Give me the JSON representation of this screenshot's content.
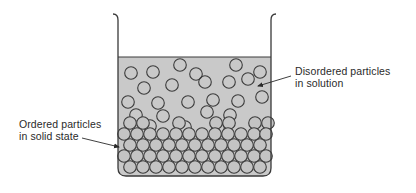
{
  "diagram": {
    "labels": {
      "disordered": {
        "line1": "Disordered particles",
        "line2": "in solution"
      },
      "ordered": {
        "line1": "Ordered particles",
        "line2": "in solid state"
      }
    },
    "colors": {
      "liquid": "#c9c9c9",
      "outline": "#3a3a3a",
      "particle_fill": "#c4c4c4",
      "text": "#2a2a2a"
    },
    "beaker": {
      "left": 118,
      "right": 271,
      "top": 14,
      "liquid_surface": 57,
      "bottom": 176,
      "corner_radius": 8
    },
    "particle_radius": 6.3,
    "disordered_particles": [
      [
        131,
        73
      ],
      [
        153,
        72
      ],
      [
        180,
        65
      ],
      [
        196,
        74
      ],
      [
        236,
        65
      ],
      [
        260,
        72
      ],
      [
        144,
        88
      ],
      [
        172,
        85
      ],
      [
        205,
        82
      ],
      [
        229,
        82
      ],
      [
        248,
        79
      ],
      [
        128,
        102
      ],
      [
        158,
        103
      ],
      [
        188,
        102
      ],
      [
        213,
        100
      ],
      [
        238,
        101
      ],
      [
        262,
        97
      ],
      [
        136,
        115
      ],
      [
        163,
        116
      ],
      [
        207,
        112
      ],
      [
        230,
        115
      ],
      [
        150,
        126
      ],
      [
        185,
        127
      ],
      [
        218,
        128
      ]
    ],
    "ordered_rows": [
      {
        "y": 123,
        "xs": [
          130,
          143,
          179,
          216,
          229,
          255,
          268
        ]
      },
      {
        "y": 134,
        "xs": [
          124,
          137,
          150,
          163,
          176,
          189,
          202,
          215,
          228,
          241,
          254,
          266
        ]
      },
      {
        "y": 145,
        "xs": [
          130,
          143,
          156,
          169,
          182,
          195,
          208,
          221,
          234,
          247,
          260
        ]
      },
      {
        "y": 156,
        "xs": [
          124,
          137,
          150,
          163,
          176,
          189,
          202,
          215,
          228,
          241,
          254,
          266
        ]
      },
      {
        "y": 167,
        "xs": [
          130,
          143,
          156,
          169,
          182,
          195,
          208,
          221,
          234,
          247,
          260
        ]
      }
    ],
    "arrows": {
      "disordered": {
        "x1": 291,
        "y1": 76,
        "x2": 258,
        "y2": 86
      },
      "ordered": {
        "x1": 82,
        "y1": 138,
        "x2": 119,
        "y2": 147
      }
    }
  }
}
